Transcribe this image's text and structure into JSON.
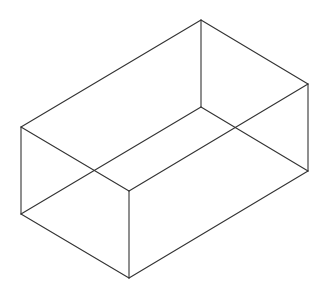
{
  "diagram": {
    "type": "isometric-wireframe-box",
    "stroke_color": "#333333",
    "stroke_width": 1.1,
    "background": "#ffffff",
    "vertices": {
      "top_back": [
        201,
        20
      ],
      "top_left": [
        21,
        127
      ],
      "top_right": [
        308,
        84
      ],
      "top_front": [
        129,
        191
      ],
      "bottom_back": [
        201,
        107
      ],
      "bottom_left": [
        21,
        214
      ],
      "bottom_right": [
        308,
        171
      ],
      "bottom_front": [
        129,
        278
      ]
    },
    "edges": [
      [
        "top_back",
        "top_left"
      ],
      [
        "top_back",
        "top_right"
      ],
      [
        "top_left",
        "top_front"
      ],
      [
        "top_right",
        "top_front"
      ],
      [
        "bottom_back",
        "bottom_left"
      ],
      [
        "bottom_back",
        "bottom_right"
      ],
      [
        "bottom_left",
        "bottom_front"
      ],
      [
        "bottom_right",
        "bottom_front"
      ],
      [
        "top_back",
        "bottom_back"
      ],
      [
        "top_left",
        "bottom_left"
      ],
      [
        "top_right",
        "bottom_right"
      ],
      [
        "top_front",
        "bottom_front"
      ]
    ]
  }
}
